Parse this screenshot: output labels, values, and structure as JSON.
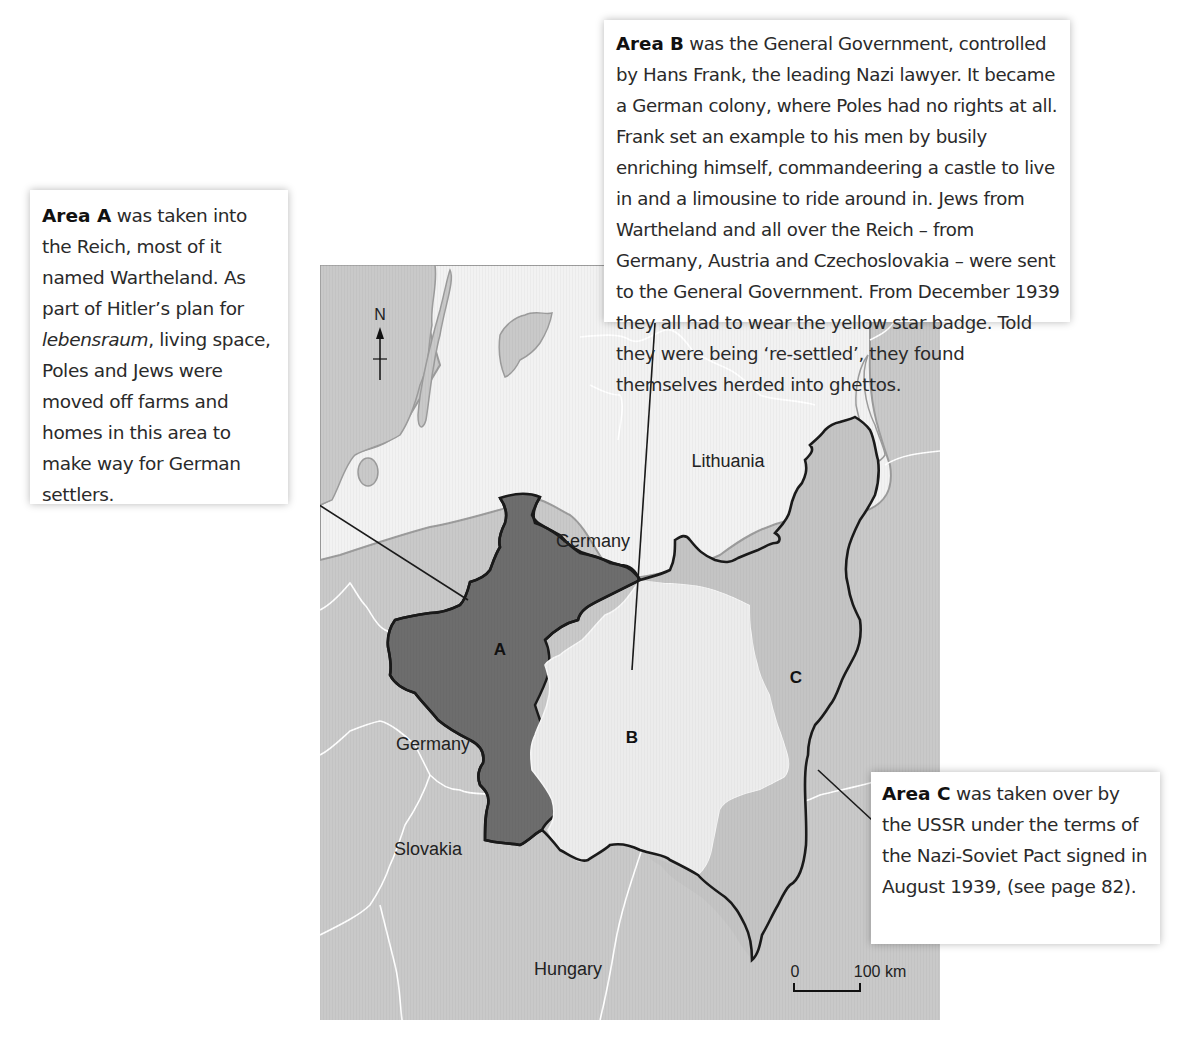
{
  "callouts": {
    "area_a": {
      "heading": "Area A",
      "text_before_italic": " was taken into the Reich, most of it named Wartheland. As part of Hitler’s plan for ",
      "italic": "lebensraum",
      "text_after_italic": ", living space, Poles and Jews were moved off farms and homes in this area to make way for German settlers."
    },
    "area_b": {
      "heading": "Area B",
      "text": " was the General Government, controlled by Hans Frank, the leading Nazi lawyer. It became a German colony, where Poles had no rights at all. Frank set an example to his men by busily enriching himself, commandeering a castle to live in and a limousine to ride around in. Jews from Wartheland and all over the Reich – from Germany, Austria and Czechoslovakia – were sent to the General Government. From December 1939 they all had to wear the yellow star badge. Told they were being ‘re-settled’, they found themselves herded into ghettos."
    },
    "area_c": {
      "heading": "Area C",
      "text": " was taken over by the USSR under the terms of the Nazi-Soviet Pact signed in August 1939, (see page 82)."
    }
  },
  "map": {
    "compass": {
      "label": "N",
      "icon": "north-arrow-icon"
    },
    "regions": [
      {
        "letter": "A",
        "fill": "#6d6d6d"
      },
      {
        "letter": "B",
        "fill": "#ececec"
      },
      {
        "letter": "C",
        "fill": "#c4c4c4"
      }
    ],
    "country_labels": {
      "lithuania": "Lithuania",
      "germany_north": "Germany",
      "germany_west": "Germany",
      "slovakia": "Slovakia",
      "hungary": "Hungary"
    },
    "scale_bar": {
      "start": "0",
      "end": "100 km"
    },
    "colors": {
      "land": "#c9c9c9",
      "sea": "#f2f2f2",
      "border_line": "#1a1a1a",
      "internal_border": "#ffffff"
    }
  }
}
